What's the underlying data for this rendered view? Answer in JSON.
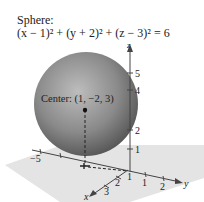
{
  "figure": {
    "title": "Sphere:",
    "equation": "(x − 1)² + (y + 2)² + (z − 3)² = 6",
    "center_label": "Center: (1, −2, 3)",
    "axes": {
      "z": {
        "label": "z",
        "ticks": [
          "5",
          "4",
          "2",
          "1"
        ]
      },
      "y": {
        "label": "y",
        "ticks": [
          "−5",
          "1",
          "2"
        ]
      },
      "x": {
        "label": "x",
        "ticks": [
          "1",
          "2",
          "3"
        ]
      }
    },
    "colors": {
      "sphere_light": "#c8c8c8",
      "sphere_dark": "#5a5a5a",
      "plane": "#e2e2e2",
      "axis": "#444444"
    }
  }
}
